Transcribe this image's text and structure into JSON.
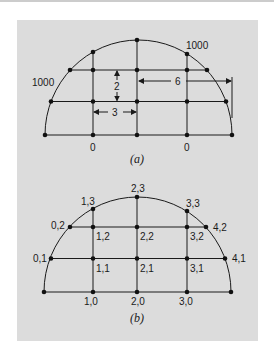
{
  "figure": {
    "panel_background": "#dcdcdc",
    "line_color": "#1a1a1a",
    "diagram_a": {
      "caption": "(a)",
      "boundary_labels": {
        "left_arc": "1000",
        "right_arc": "1000",
        "bottom_left": "0",
        "bottom_right": "0"
      },
      "dimensions": {
        "vertical_spacing": "2",
        "horizontal_spacing": "3",
        "radius": "6"
      }
    },
    "diagram_b": {
      "caption": "(b)",
      "node_labels": {
        "n13": "1,3",
        "n23": "2,3",
        "n33": "3,3",
        "n02": "0,2",
        "n12": "1,2",
        "n22": "2,2",
        "n32": "3,2",
        "n42": "4,2",
        "n01": "0,1",
        "n11": "1,1",
        "n21": "2,1",
        "n31": "3,1",
        "n41": "4,1",
        "n10": "1,0",
        "n20": "2,0",
        "n30": "3,0"
      }
    }
  }
}
